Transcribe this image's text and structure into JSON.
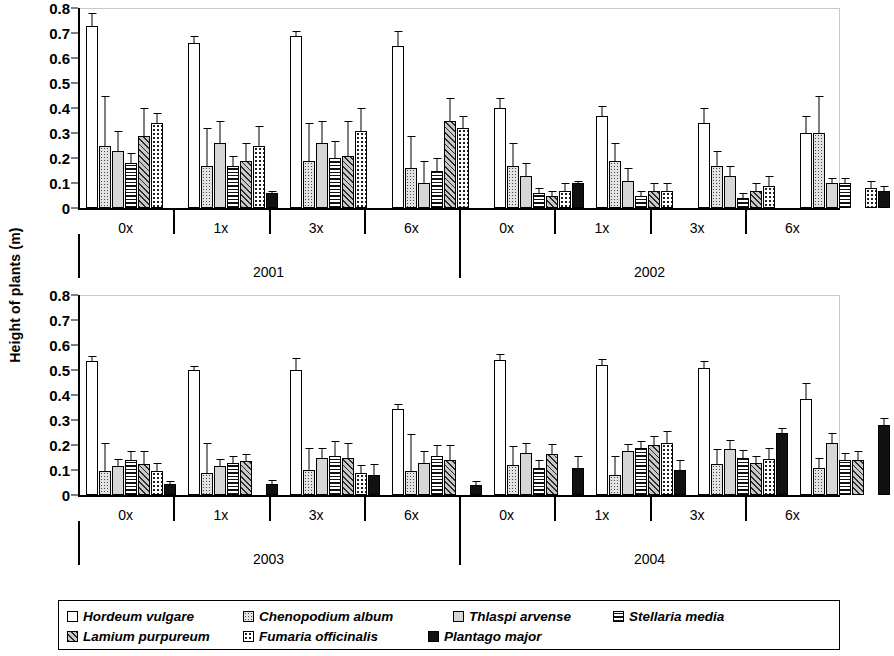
{
  "chart_data": {
    "type": "bar",
    "title": "",
    "xlabel": "",
    "ylabel": "Height of plants (m)",
    "ylim": [
      0,
      0.8
    ],
    "yticks": [
      "0.8",
      "0.7",
      "0.6",
      "0.5",
      "0.4",
      "0.3",
      "0.2",
      "0.1",
      "0"
    ],
    "ytick_values": [
      0.8,
      0.7,
      0.6,
      0.5,
      0.4,
      0.3,
      0.2,
      0.1,
      0
    ],
    "grid": false,
    "legend_position": "bottom",
    "legend": [
      {
        "name": "Hordeum vulgare",
        "pattern": "white"
      },
      {
        "name": "Chenopodium album",
        "pattern": "fine-dotted"
      },
      {
        "name": "Thlaspi arvense",
        "pattern": "light-gray"
      },
      {
        "name": "Stellaria media",
        "pattern": "horizontal-stripes"
      },
      {
        "name": "Lamium purpureum",
        "pattern": "diagonal-hatch"
      },
      {
        "name": "Fumaria officinalis",
        "pattern": "sparse-dotted"
      },
      {
        "name": "Plantago major",
        "pattern": "black"
      }
    ],
    "series": [
      {
        "name": "Hordeum vulgare",
        "pattern": "white"
      },
      {
        "name": "Chenopodium album",
        "pattern": "fine-dotted"
      },
      {
        "name": "Thlaspi arvense",
        "pattern": "light-gray"
      },
      {
        "name": "Stellaria media",
        "pattern": "horizontal-stripes"
      },
      {
        "name": "Lamium purpureum",
        "pattern": "diagonal-hatch"
      },
      {
        "name": "Fumaria officinalis",
        "pattern": "sparse-dotted"
      },
      {
        "name": "Plantago major",
        "pattern": "black"
      }
    ],
    "doses": [
      "0x",
      "1x",
      "3x",
      "6x"
    ],
    "panels": [
      {
        "id": "top",
        "years": [
          {
            "year": "2001",
            "groups": [
              {
                "dose": "0x",
                "values": [
                  0.73,
                  0.25,
                  0.23,
                  0.18,
                  0.29,
                  0.34,
                  null
                ],
                "errors": [
                  0.05,
                  0.2,
                  0.08,
                  0.04,
                  0.11,
                  0.04,
                  null
                ]
              },
              {
                "dose": "1x",
                "values": [
                  0.66,
                  0.17,
                  0.26,
                  0.17,
                  0.19,
                  0.25,
                  0.06
                ],
                "errors": [
                  0.03,
                  0.15,
                  0.09,
                  0.04,
                  0.07,
                  0.08,
                  0.01
                ]
              },
              {
                "dose": "3x",
                "values": [
                  0.69,
                  0.19,
                  0.26,
                  0.2,
                  0.21,
                  0.31,
                  null
                ],
                "errors": [
                  0.02,
                  0.15,
                  0.09,
                  0.07,
                  0.14,
                  0.09,
                  null
                ]
              },
              {
                "dose": "6x",
                "values": [
                  0.65,
                  0.16,
                  0.1,
                  0.15,
                  0.35,
                  0.32,
                  null
                ],
                "errors": [
                  0.06,
                  0.13,
                  0.09,
                  0.05,
                  0.09,
                  0.05,
                  null
                ]
              }
            ]
          },
          {
            "year": "2002",
            "groups": [
              {
                "dose": "0x",
                "values": [
                  0.4,
                  0.17,
                  0.13,
                  0.06,
                  0.05,
                  0.07,
                  0.1
                ],
                "errors": [
                  0.04,
                  0.09,
                  0.05,
                  0.02,
                  0.02,
                  0.03,
                  0.01
                ]
              },
              {
                "dose": "1x",
                "values": [
                  0.37,
                  0.19,
                  0.11,
                  0.05,
                  0.07,
                  0.07,
                  null
                ],
                "errors": [
                  0.04,
                  0.07,
                  0.05,
                  0.02,
                  0.03,
                  0.03,
                  null
                ]
              },
              {
                "dose": "3x",
                "values": [
                  0.34,
                  0.17,
                  0.13,
                  0.04,
                  0.07,
                  0.09,
                  null
                ],
                "errors": [
                  0.06,
                  0.06,
                  0.04,
                  0.02,
                  0.03,
                  0.04,
                  null
                ]
              },
              {
                "dose": "6x",
                "values": [
                  0.3,
                  0.3,
                  0.1,
                  0.1,
                  null,
                  0.08,
                  0.07
                ],
                "errors": [
                  0.07,
                  0.15,
                  0.02,
                  0.02,
                  null,
                  0.03,
                  0.02
                ]
              }
            ]
          }
        ]
      },
      {
        "id": "bottom",
        "years": [
          {
            "year": "2003",
            "groups": [
              {
                "dose": "0x",
                "values": [
                  0.535,
                  0.095,
                  0.115,
                  0.14,
                  0.125,
                  0.095,
                  0.045
                ],
                "errors": [
                  0.02,
                  0.115,
                  0.03,
                  0.035,
                  0.05,
                  0.035,
                  0.012
                ]
              },
              {
                "dose": "1x",
                "values": [
                  0.5,
                  0.09,
                  0.115,
                  0.13,
                  0.135,
                  null,
                  0.045
                ],
                "errors": [
                  0.015,
                  0.12,
                  0.03,
                  0.025,
                  0.03,
                  null,
                  0.015
                ]
              },
              {
                "dose": "3x",
                "values": [
                  0.5,
                  0.1,
                  0.15,
                  0.155,
                  0.15,
                  0.09,
                  0.08
                ],
                "errors": [
                  0.05,
                  0.09,
                  0.04,
                  0.06,
                  0.06,
                  0.03,
                  0.045
                ]
              },
              {
                "dose": "6x",
                "values": [
                  0.345,
                  0.095,
                  0.13,
                  0.155,
                  0.14,
                  null,
                  0.04
                ],
                "errors": [
                  0.02,
                  0.15,
                  0.045,
                  0.045,
                  0.06,
                  null,
                  0.015
                ]
              }
            ]
          },
          {
            "year": "2004",
            "groups": [
              {
                "dose": "0x",
                "values": [
                  0.54,
                  0.12,
                  0.17,
                  0.11,
                  0.165,
                  null,
                  0.11
                ],
                "errors": [
                  0.025,
                  0.075,
                  0.04,
                  0.03,
                  0.04,
                  null,
                  0.045
                ]
              },
              {
                "dose": "1x",
                "values": [
                  0.52,
                  0.08,
                  0.175,
                  0.19,
                  0.2,
                  0.21,
                  0.1
                ],
                "errors": [
                  0.025,
                  0.075,
                  0.03,
                  0.025,
                  0.035,
                  0.045,
                  0.04
                ]
              },
              {
                "dose": "3x",
                "values": [
                  0.51,
                  0.125,
                  0.185,
                  0.15,
                  0.13,
                  0.145,
                  0.25
                ],
                "errors": [
                  0.025,
                  0.06,
                  0.035,
                  0.03,
                  0.025,
                  0.045,
                  0.02
                ]
              },
              {
                "dose": "6x",
                "values": [
                  0.385,
                  0.11,
                  0.21,
                  0.14,
                  0.14,
                  null,
                  0.28
                ],
                "errors": [
                  0.065,
                  0.04,
                  0.04,
                  0.03,
                  0.035,
                  null,
                  0.03
                ]
              }
            ]
          }
        ]
      }
    ]
  }
}
